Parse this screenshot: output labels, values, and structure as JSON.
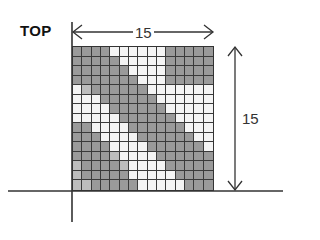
{
  "labels": {
    "top": "TOP",
    "width_dimension": "15",
    "height_dimension": "15"
  },
  "grid": {
    "columns": 15,
    "rows": 15,
    "shading_legend": {
      "0": "unshaded",
      "1": "shaded",
      "2": "light-shaded"
    },
    "cells": [
      [
        1,
        1,
        1,
        1,
        0,
        0,
        0,
        0,
        0,
        0,
        1,
        1,
        1,
        1,
        1
      ],
      [
        1,
        1,
        1,
        1,
        1,
        0,
        0,
        0,
        0,
        0,
        1,
        1,
        1,
        1,
        1
      ],
      [
        1,
        1,
        1,
        1,
        1,
        1,
        0,
        0,
        0,
        0,
        1,
        1,
        1,
        1,
        1
      ],
      [
        1,
        1,
        1,
        1,
        1,
        1,
        1,
        0,
        0,
        0,
        1,
        1,
        1,
        1,
        1
      ],
      [
        0,
        2,
        1,
        1,
        1,
        1,
        1,
        1,
        0,
        0,
        0,
        0,
        0,
        0,
        0
      ],
      [
        0,
        0,
        0,
        1,
        1,
        1,
        1,
        1,
        1,
        0,
        0,
        0,
        0,
        0,
        0
      ],
      [
        0,
        0,
        0,
        0,
        1,
        1,
        1,
        1,
        1,
        1,
        0,
        0,
        0,
        0,
        0
      ],
      [
        0,
        0,
        0,
        0,
        0,
        1,
        1,
        1,
        1,
        1,
        1,
        0,
        0,
        0,
        0
      ],
      [
        1,
        1,
        0,
        0,
        0,
        0,
        1,
        1,
        1,
        1,
        1,
        1,
        0,
        0,
        0
      ],
      [
        1,
        1,
        1,
        0,
        0,
        0,
        0,
        1,
        1,
        1,
        1,
        1,
        1,
        0,
        0
      ],
      [
        1,
        1,
        1,
        1,
        0,
        0,
        0,
        0,
        1,
        1,
        1,
        1,
        1,
        1,
        0
      ],
      [
        1,
        1,
        1,
        1,
        2,
        0,
        0,
        0,
        0,
        1,
        1,
        1,
        1,
        1,
        1
      ],
      [
        2,
        1,
        1,
        1,
        1,
        2,
        0,
        0,
        0,
        0,
        1,
        1,
        1,
        1,
        1
      ],
      [
        2,
        1,
        1,
        1,
        1,
        1,
        0,
        0,
        0,
        0,
        0,
        1,
        1,
        1,
        1
      ],
      [
        2,
        2,
        1,
        1,
        1,
        1,
        1,
        0,
        0,
        0,
        0,
        0,
        1,
        1,
        1
      ]
    ]
  },
  "colors": {
    "line": "#333333",
    "shaded": "#9a9a9a",
    "light_shaded": "#bdbdbd",
    "unshaded": "#f4f4f4"
  }
}
